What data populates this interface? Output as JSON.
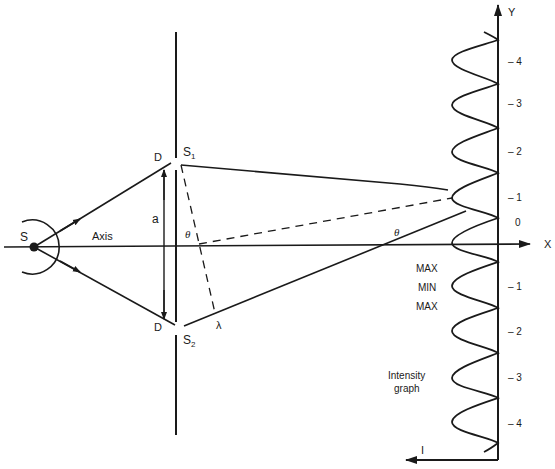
{
  "diagram": {
    "type": "double-slit interference",
    "labels": {
      "source": "S",
      "axis": "Axis",
      "slit_upper_edge": "D",
      "slit_lower_edge": "D",
      "slit_separation": "a",
      "slit1_main": "S",
      "slit1_sub": "1",
      "slit2_main": "S",
      "slit2_sub": "2",
      "angle_near": "θ",
      "angle_far": "θ",
      "path_difference": "λ",
      "x_axis": "X",
      "y_axis": "Y",
      "intensity_axis": "I",
      "max_label_1": "MAX",
      "min_label": "MIN",
      "max_label_2": "MAX",
      "intensity_graph_line1": "Intensity",
      "intensity_graph_line2": "graph"
    },
    "order_ticks_upper": [
      "– 4",
      "– 3",
      "– 2",
      "– 1",
      "0"
    ],
    "order_ticks_lower": [
      "– 1",
      "– 2",
      "– 3",
      "– 4"
    ],
    "colors": {
      "ink": "#1a1a1a",
      "background": "#ffffff"
    }
  }
}
